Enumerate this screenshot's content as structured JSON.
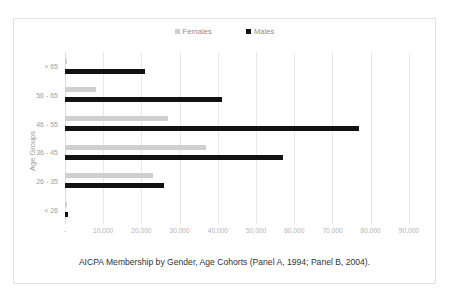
{
  "chart_data": {
    "type": "bar",
    "orientation": "horizontal",
    "title": "",
    "caption": "AICPA Membership by Gender, Age Cohorts (Panel A, 1994; Panel B, 2004).",
    "xlabel": "",
    "ylabel": "Age Groups",
    "categories": [
      "> 65",
      "56 - 65",
      "46 - 55",
      "36 - 45",
      "26 - 35",
      "< 26"
    ],
    "series": [
      {
        "name": "Females",
        "color": "#cfcfcf",
        "values": [
          500,
          8000,
          27000,
          37000,
          23000,
          600
        ]
      },
      {
        "name": "Males",
        "color": "#121212",
        "values": [
          21000,
          41000,
          77000,
          57000,
          26000,
          900
        ]
      }
    ],
    "xlim": [
      0,
      95000
    ],
    "xticks": [
      0,
      10000,
      20000,
      30000,
      40000,
      50000,
      60000,
      70000,
      80000,
      90000
    ],
    "xtick_labels": [
      "-",
      "10,000",
      "20,000",
      "30,000",
      "40,000",
      "50,000",
      "60,000",
      "70,000",
      "80,000",
      "90,000"
    ],
    "grid": true,
    "legend_position": "top-center"
  },
  "legend": {
    "items": [
      {
        "label": "Females",
        "color": "#cfcfcf"
      },
      {
        "label": "Males",
        "color": "#121212"
      }
    ]
  },
  "axes": {
    "y_title": "Age Groups",
    "y_ticks": [
      "> 65",
      "56 - 65",
      "46 - 55",
      "36 - 45",
      "26 - 35",
      "< 26"
    ],
    "x_ticks": [
      "-",
      "10,000",
      "20,000",
      "30,000",
      "40,000",
      "50,000",
      "60,000",
      "70,000",
      "80,000",
      "90,000"
    ]
  },
  "caption": {
    "text": "AICPA Membership by Gender, Age Cohorts (Panel A, 1994; Panel B, 2004)."
  }
}
